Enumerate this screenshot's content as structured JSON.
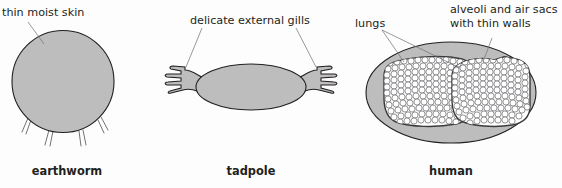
{
  "figure": {
    "background_color": "#fdfdfd",
    "body_fill_color": "#bdbdbd",
    "outline_color": "#231f20",
    "leader_line_color": "#6d6e71",
    "text_color": "#231f20"
  },
  "panels": [
    {
      "id": "earthworm",
      "caption": "earthworm",
      "annotations": [
        {
          "id": "thin-moist-skin",
          "text": "thin moist skin"
        }
      ]
    },
    {
      "id": "tadpole",
      "caption": "tadpole",
      "annotations": [
        {
          "id": "delicate-external-gills",
          "text": "delicate external gills"
        }
      ]
    },
    {
      "id": "human",
      "caption": "human",
      "annotations": [
        {
          "id": "lungs",
          "text": "lungs"
        },
        {
          "id": "alveoli-line-1",
          "text": "alveoli and air sacs"
        },
        {
          "id": "alveoli-line-2",
          "text": "with thin walls"
        }
      ]
    }
  ]
}
